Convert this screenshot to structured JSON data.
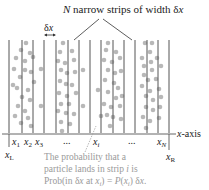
{
  "title": {
    "N": "N",
    "rest": " narrow strips of width ",
    "delta": "δ",
    "x": "x"
  },
  "width_marker": {
    "delta": "δ",
    "x": "x"
  },
  "axis": {
    "label": "x-axis",
    "label_x": "x",
    "label_rest": "-axis"
  },
  "ticks": {
    "x1": {
      "var": "x",
      "sub": "1"
    },
    "x2": {
      "var": "x",
      "sub": "2"
    },
    "x3": {
      "var": "x",
      "sub": "3"
    },
    "dots_left": "...",
    "xi": {
      "var": "x",
      "sub": "i"
    },
    "dots_right": "...",
    "xN": {
      "var": "x",
      "sub": "N"
    },
    "xL": {
      "var": "x",
      "sub": "L"
    },
    "xR": {
      "var": "x",
      "sub": "R"
    }
  },
  "annotation": {
    "line1": "The probability that a",
    "line2_a": "particle lands in strip ",
    "line2_i": "i",
    "line2_b": " is",
    "line3_a": "Prob(in δ",
    "line3_x": "x",
    "line3_b": " at ",
    "line3_xi": "x",
    "line3_sub": "i",
    "line3_c": ") = ",
    "line3_P": "P",
    "line3_d": "(",
    "line3_x2": "x",
    "line3_sub2": "i",
    "line3_e": ") δ",
    "line3_x3": "x",
    "line3_f": "."
  },
  "colors": {
    "line": "#555555",
    "dot": "#b8b8b8",
    "annotation": "#9a9a9a",
    "text": "#222222"
  },
  "strip_lines_x": [
    9,
    22,
    33,
    44,
    56,
    68,
    79,
    90,
    101,
    113,
    124,
    135,
    147,
    158,
    169
  ],
  "particles": [
    [
      26,
      43
    ],
    [
      21,
      50
    ],
    [
      30,
      53
    ],
    [
      16,
      58
    ],
    [
      25,
      61
    ],
    [
      33,
      57
    ],
    [
      14,
      69
    ],
    [
      25,
      70
    ],
    [
      31,
      72
    ],
    [
      20,
      77
    ],
    [
      34,
      82
    ],
    [
      17,
      88
    ],
    [
      28,
      90
    ],
    [
      22,
      97
    ],
    [
      30,
      100
    ],
    [
      18,
      106
    ],
    [
      25,
      111
    ],
    [
      15,
      116
    ],
    [
      28,
      118
    ],
    [
      21,
      123
    ],
    [
      31,
      126
    ],
    [
      41,
      69
    ],
    [
      41,
      106
    ],
    [
      13,
      85
    ],
    [
      63,
      43
    ],
    [
      60,
      52
    ],
    [
      72,
      51
    ],
    [
      58,
      61
    ],
    [
      65,
      63
    ],
    [
      74,
      60
    ],
    [
      61,
      70
    ],
    [
      67,
      73
    ],
    [
      75,
      72
    ],
    [
      60,
      81
    ],
    [
      66,
      84
    ],
    [
      72,
      85
    ],
    [
      59,
      93
    ],
    [
      67,
      96
    ],
    [
      76,
      93
    ],
    [
      61,
      104
    ],
    [
      69,
      104
    ],
    [
      58,
      111
    ],
    [
      66,
      113
    ],
    [
      74,
      114
    ],
    [
      61,
      122
    ],
    [
      70,
      124
    ],
    [
      62,
      131
    ],
    [
      83,
      70
    ],
    [
      83,
      106
    ],
    [
      108,
      43
    ],
    [
      106,
      50
    ],
    [
      116,
      52
    ],
    [
      104,
      60
    ],
    [
      112,
      62
    ],
    [
      120,
      58
    ],
    [
      108,
      70
    ],
    [
      115,
      73
    ],
    [
      121,
      71
    ],
    [
      105,
      80
    ],
    [
      114,
      83
    ],
    [
      118,
      88
    ],
    [
      108,
      92
    ],
    [
      116,
      98
    ],
    [
      122,
      96
    ],
    [
      104,
      104
    ],
    [
      111,
      107
    ],
    [
      120,
      106
    ],
    [
      107,
      115
    ],
    [
      113,
      117
    ],
    [
      121,
      119
    ],
    [
      110,
      126
    ],
    [
      98,
      90
    ],
    [
      101,
      116
    ],
    [
      145,
      43
    ],
    [
      152,
      43
    ],
    [
      150,
      52
    ],
    [
      142,
      58
    ],
    [
      151,
      62
    ],
    [
      157,
      58
    ],
    [
      144,
      66
    ],
    [
      152,
      70
    ],
    [
      161,
      66
    ],
    [
      144,
      75
    ],
    [
      148,
      80
    ],
    [
      156,
      79
    ],
    [
      142,
      86
    ],
    [
      150,
      91
    ],
    [
      159,
      89
    ],
    [
      146,
      96
    ],
    [
      153,
      100
    ],
    [
      161,
      97
    ],
    [
      146,
      107
    ],
    [
      153,
      110
    ],
    [
      160,
      107
    ],
    [
      143,
      117
    ],
    [
      150,
      121
    ],
    [
      159,
      118
    ],
    [
      146,
      128
    ]
  ]
}
